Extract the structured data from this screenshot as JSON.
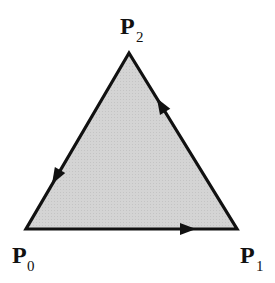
{
  "diagram": {
    "type": "oriented-triangle",
    "fill_color": "#d2d2d2",
    "stroke_color": "#111111",
    "vertices": [
      {
        "id": "P0",
        "label": "P",
        "subscript": "0",
        "x": 26,
        "y": 229
      },
      {
        "id": "P1",
        "label": "P",
        "subscript": "1",
        "x": 237,
        "y": 229
      },
      {
        "id": "P2",
        "label": "P",
        "subscript": "2",
        "x": 129,
        "y": 53
      }
    ],
    "edges": [
      {
        "from": "P0",
        "to": "P1",
        "arrow": "forward"
      },
      {
        "from": "P1",
        "to": "P2",
        "arrow": "forward"
      },
      {
        "from": "P2",
        "to": "P0",
        "arrow": "forward"
      }
    ],
    "labels": {
      "p0": {
        "main": "P",
        "sub": "0"
      },
      "p1": {
        "main": "P",
        "sub": "1"
      },
      "p2": {
        "main": "P",
        "sub": "2"
      }
    }
  }
}
